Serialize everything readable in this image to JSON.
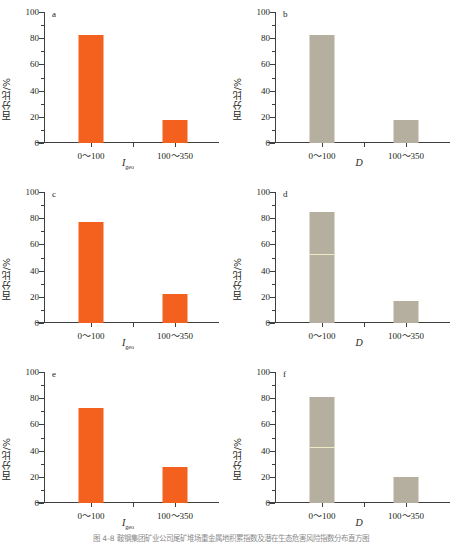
{
  "figure": {
    "caption": "图 4-8   鞍钢集团矿业公司尾矿堆场重金属地积累指数及潜在生态危害风险指数分布直方图",
    "width": 462,
    "height": 546,
    "colors": {
      "orange": "#F4601E",
      "tan": "#B4AF9F",
      "axis": "#3f3f3f",
      "text": "#231f20"
    }
  },
  "chart_data": [
    {
      "type": "bar",
      "panel": "a",
      "title": "a",
      "xlabel": "I",
      "xlabel_sub": "geo",
      "ylabel": "百分比/%",
      "categories": [
        "0～100",
        "100～350"
      ],
      "values": [
        82.3,
        17.7
      ],
      "ylim": [
        0,
        100
      ],
      "yticks": [
        0,
        20,
        40,
        60,
        80,
        100
      ],
      "color": "#F4601E",
      "grid": false,
      "legend": "none"
    },
    {
      "type": "bar",
      "panel": "b",
      "title": "b",
      "xlabel": "D",
      "xlabel_sub": "",
      "ylabel": "百分比/%",
      "categories": [
        "0～100",
        "100～350"
      ],
      "values": [
        82.5,
        17.5
      ],
      "ylim": [
        0,
        100
      ],
      "yticks": [
        0,
        20,
        40,
        60,
        80,
        100
      ],
      "color": "#B4AF9F",
      "grid": false,
      "legend": "none"
    },
    {
      "type": "bar",
      "panel": "c",
      "title": "c",
      "xlabel": "I",
      "xlabel_sub": "geo",
      "ylabel": "百分比/%",
      "categories": [
        "0～100",
        "100～350"
      ],
      "values": [
        77.3,
        22.3
      ],
      "ylim": [
        0,
        100
      ],
      "yticks": [
        0,
        20,
        40,
        60,
        80,
        100
      ],
      "color": "#F4601E",
      "grid": false,
      "legend": "none"
    },
    {
      "type": "bar",
      "panel": "d",
      "title": "d",
      "xlabel": "D",
      "xlabel_sub": "",
      "ylabel": "百分比/%",
      "categories": [
        "0～100",
        "100～350"
      ],
      "values": [
        85.0,
        17.0
      ],
      "ylim": [
        0,
        100
      ],
      "yticks": [
        0,
        20,
        40,
        60,
        80,
        100
      ],
      "color": "#B4AF9F",
      "seam_at": 52,
      "grid": false,
      "legend": "none"
    },
    {
      "type": "bar",
      "panel": "e",
      "title": "e",
      "xlabel": "I",
      "xlabel_sub": "geo",
      "ylabel": "百分比/%",
      "categories": [
        "0～100",
        "100～350"
      ],
      "values": [
        72.8,
        27.3
      ],
      "ylim": [
        0,
        100
      ],
      "yticks": [
        0,
        20,
        40,
        60,
        80,
        100
      ],
      "color": "#F4601E",
      "grid": false,
      "legend": "none"
    },
    {
      "type": "bar",
      "panel": "f",
      "title": "f",
      "xlabel": "D",
      "xlabel_sub": "",
      "ylabel": "百分比/%",
      "categories": [
        "0～100",
        "100～350"
      ],
      "values": [
        81.2,
        19.6
      ],
      "ylim": [
        0,
        100
      ],
      "yticks": [
        0,
        20,
        40,
        60,
        80,
        100
      ],
      "color": "#B4AF9F",
      "seam_at": 42,
      "grid": false,
      "legend": "none"
    }
  ]
}
